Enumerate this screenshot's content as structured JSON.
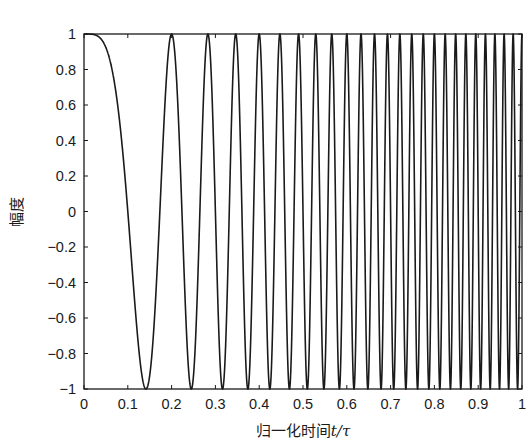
{
  "chart_data": {
    "type": "line",
    "title": "",
    "xlabel": "归一化时间t/τ",
    "xlabel_parts": {
      "prefix": "归一化时间",
      "var": "t/τ"
    },
    "ylabel": "幅度",
    "xlim": [
      0,
      1
    ],
    "ylim": [
      -1,
      1
    ],
    "xticks": [
      0,
      0.1,
      0.2,
      0.3,
      0.4,
      0.5,
      0.6,
      0.7,
      0.8,
      0.9,
      1
    ],
    "xtick_labels": [
      "0",
      "0.1",
      "0.2",
      "0.3",
      "0.4",
      "0.5",
      "0.6",
      "0.7",
      "0.8",
      "0.9",
      "1"
    ],
    "yticks": [
      1,
      0.8,
      0.6,
      0.4,
      0.2,
      0,
      -0.2,
      -0.4,
      -0.6,
      -0.8,
      -1
    ],
    "ytick_labels": [
      "1",
      "0.8",
      "0.6",
      "0.4",
      "0.2",
      "0",
      "−0.2",
      "−0.4",
      "−0.6",
      "−0.8",
      "−1"
    ],
    "grid": false,
    "legend": null,
    "series": [
      {
        "name": "LFM chirp (real part)",
        "formula": "y = cos(50*pi*t^2)",
        "color": "#1a1a1a",
        "key_points": [
          {
            "t": 0.0,
            "y": 1
          },
          {
            "t": 0.141,
            "y": -1
          },
          {
            "t": 0.2,
            "y": 1
          },
          {
            "t": 0.245,
            "y": -1
          },
          {
            "t": 0.283,
            "y": 1
          },
          {
            "t": 0.316,
            "y": -1
          },
          {
            "t": 0.346,
            "y": 1
          },
          {
            "t": 0.374,
            "y": -1
          },
          {
            "t": 0.4,
            "y": 1
          },
          {
            "t": 1.0,
            "y": 1
          }
        ],
        "cycles_total": 25
      }
    ]
  },
  "labels": {
    "xlabel_prefix": "归一化时间",
    "xlabel_var": "t/τ",
    "ylabel": "幅度"
  }
}
